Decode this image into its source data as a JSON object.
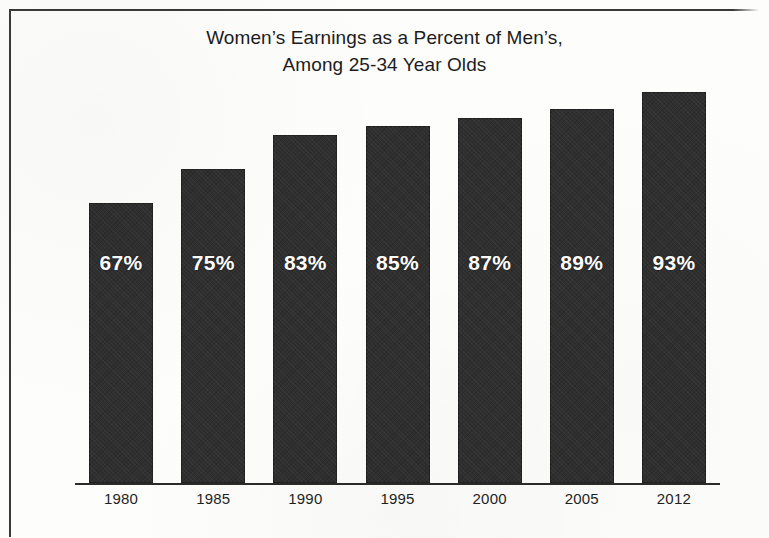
{
  "figure": {
    "title_line_1": "Women’s Earnings as a Percent of Men’s,",
    "title_line_2": "Among 25-34 Year Olds",
    "bar_color": "#2f2f2f",
    "value_label_color": "#ffffff",
    "axis_color": "#2b2b2b",
    "frame_color": "#3a3a3a",
    "background_color": "#fdfdfc"
  },
  "chart_data": {
    "type": "bar",
    "title": "Women’s Earnings as a Percent of Men’s, Among 25-34 Year Olds",
    "subtitle": "",
    "xlabel": "",
    "ylabel": "",
    "categories": [
      "1980",
      "1985",
      "1990",
      "1995",
      "2000",
      "2005",
      "2012"
    ],
    "values": [
      67,
      75,
      83,
      85,
      87,
      89,
      93
    ],
    "value_labels": [
      "67%",
      "75%",
      "83%",
      "85%",
      "87%",
      "89%",
      "93%"
    ],
    "ylim": [
      0,
      100
    ],
    "grid": false,
    "legend": null,
    "legend_position": "none",
    "series": [
      {
        "name": "Women’s earnings as a percent of men’s",
        "values": [
          67,
          75,
          83,
          85,
          87,
          89,
          93
        ]
      }
    ],
    "annotations": []
  }
}
